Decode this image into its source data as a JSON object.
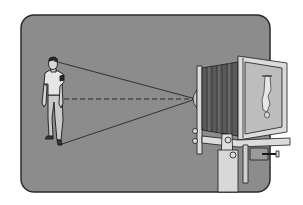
{
  "figure": {
    "elements": [
      {
        "name": "person",
        "description": "standing man, the photographed subject"
      },
      {
        "name": "light-rays",
        "description": "lines from head and feet converging through lens"
      },
      {
        "name": "optical-axis",
        "description": "dashed line from subject center through lens"
      },
      {
        "name": "view-camera",
        "description": "bellows view camera on stand"
      },
      {
        "name": "inverted-image",
        "description": "upside-down figure on ground glass"
      }
    ]
  },
  "colors": {
    "background": "#ffffff",
    "panel": "#8c8c8c",
    "panel_border": "#2a2a2a",
    "line": "#1a1a1a",
    "camera_light": "#dcdcdc",
    "bellows_dark": "#555555"
  }
}
